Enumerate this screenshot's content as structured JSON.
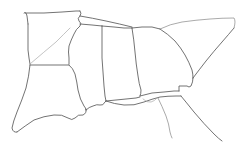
{
  "map": {
    "title": "Southeastern United States outline map",
    "type": "line-drawing",
    "background_color": "#ffffff",
    "stroke_color": "#5a5a5a",
    "stroke_color_light": "#8d8d8d",
    "stroke_color_faint": "#a9a9a9",
    "width": 246,
    "height": 151,
    "regions": [
      {
        "name": "arkansas",
        "label": "",
        "path": "M24 14 L26 11 L27 15 L28 26 L28 40 L28 52 L29 60 L30 66 L36 66 L52 66 L68 66 L69 60 L69 55 L68 48 L68 40 L68 30 L69 22 L70 15 L72 12 L76 11 L80 11 L84 11 L75 12 L60 13 L44 14 Z"
      },
      {
        "name": "louisiana",
        "label": "",
        "path": "M30 66 L30 74 L28 84 L26 94 L22 104 L18 114 L14 122 L12 128 L14 132 L18 133 L24 129 L30 123 L36 119 L44 116 L52 114 L60 114 L66 117 L70 120 L74 119 L76 115 L80 113 L84 114 L86 111 L84 107 L82 101 L80 94 L79 86 L78 78 L76 70 L74 66 L68 66 Z"
      },
      {
        "name": "mississippi",
        "label": "",
        "path": "M69 22 L68 30 L68 40 L68 48 L69 55 L69 60 L68 66 L74 66 L76 70 L78 78 L79 86 L80 94 L82 101 L84 107 L86 111 L92 107 L98 105 L103 104 L106 101 L105 95 L104 88 L103 78 L102 66 L102 52 L102 40 L102 30 L102 26 L92 25 L82 24 L75 23 Z"
      },
      {
        "name": "alabama",
        "label": "",
        "path": "M102 26 L102 40 L102 52 L102 66 L103 78 L104 88 L105 95 L106 101 L112 100 L120 99 L130 98 L140 97 L142 93 L140 88 L138 82 L137 74 L136 64 L135 54 L134 44 L133 34 L132 28 L120 27 L110 26 Z"
      },
      {
        "name": "georgia",
        "label": "",
        "path": "M132 28 L133 34 L134 44 L135 54 L136 64 L137 74 L138 82 L140 88 L142 93 L152 92 L162 91 L172 90 L178 90 L178 84 L186 84 L188 90 L192 88 L194 82 L192 74 L190 66 L187 58 L184 50 L178 42 L170 34 L160 29 L148 27 Z"
      },
      {
        "name": "south-carolina",
        "label": "",
        "path": "M160 29 L170 34 L178 42 L184 50 L187 58 L190 66 L194 74 L200 68 L208 58 L216 48 L224 38 L230 30 L236 25 L230 22 L220 21 L208 22 L196 24 L182 26 Z"
      },
      {
        "name": "tennessee-border",
        "label": "",
        "path": "M84 11 L96 14 L110 18 L124 22 L136 25 L148 27 L160 29"
      },
      {
        "name": "florida-panhandle",
        "label": "",
        "path": "M86 111 L92 107 L98 105 L103 104 L106 101 L112 100 L120 99 L130 98 L140 97 L152 92 L162 91 L172 90 L178 90 L180 96 L186 101 L196 112 L206 124 L216 134 L222 140"
      },
      {
        "name": "florida-peninsula-hint",
        "label": "",
        "path": "M160 96 L164 104 L168 112 L170 122 L172 130 L174 136"
      }
    ],
    "strokes": [
      {
        "name": "arkansas-north-edge",
        "weight": "normal",
        "d": "M24 13 Q26 11 27 16 L28 24"
      },
      {
        "name": "arkansas-top-line",
        "weight": "normal",
        "d": "M25 13 L44 13 L62 12 L76 11 L80 11"
      },
      {
        "name": "arkansas-west-edge",
        "weight": "normal",
        "d": "M28 24 L28 38 L28 50 L29 58 L30 64"
      },
      {
        "name": "arkansas-mississippi-river",
        "weight": "normal",
        "d": "M80 11 Q82 13 80 16 Q77 18 79 21 Q82 23 80 26 Q76 29 74 34 Q71 40 69 46 Q68 52 69 58 L69 64"
      },
      {
        "name": "arkansas-south-line",
        "weight": "normal",
        "d": "M30 65 L44 65 L58 65 L69 65"
      },
      {
        "name": "arkansas-ouachita-diagonal",
        "weight": "faint",
        "d": "M30 64 Q44 52 56 42 Q64 34 70 28"
      },
      {
        "name": "louisiana-west-edge",
        "weight": "normal",
        "d": "M30 65 Q29 76 26 88 Q22 100 17 112 Q13 122 12 128 Q13 133 17 132"
      },
      {
        "name": "louisiana-gulf-coast",
        "weight": "normal",
        "d": "M17 132 Q25 126 34 120 Q44 116 54 115 Q62 114 68 118 Q72 121 75 118 Q78 114 83 115 Q87 113 86 109"
      },
      {
        "name": "louisiana-east-border",
        "weight": "normal",
        "d": "M69 65 Q73 68 75 74 Q77 82 78 90 Q80 100 84 106 Q86 108 86 110"
      },
      {
        "name": "mississippi-north-line",
        "weight": "normal",
        "d": "M80 24 L92 25 L102 26"
      },
      {
        "name": "mississippi-alabama-border",
        "weight": "normal",
        "d": "M102 26 L102 42 L102 58 L103 72 L104 86 L105 96 L106 101"
      },
      {
        "name": "mississippi-gulf-coast",
        "weight": "normal",
        "d": "M86 110 Q89 107 93 106 Q97 104 100 105 Q103 106 105 102 L106 101"
      },
      {
        "name": "alabama-north-line",
        "weight": "normal",
        "d": "M102 26 L114 27 L124 28 L132 28"
      },
      {
        "name": "alabama-georgia-border",
        "weight": "normal",
        "d": "M132 28 Q134 40 135 52 Q136 64 138 76 Q139 84 141 90 Q141 94 140 96"
      },
      {
        "name": "alabama-florida-line",
        "weight": "normal",
        "d": "M106 101 L116 100 L126 99 L136 98 L140 97"
      },
      {
        "name": "georgia-tennessee-line",
        "weight": "normal",
        "d": "M132 28 L142 27 L152 27 L160 29"
      },
      {
        "name": "georgia-south-carolina-border",
        "weight": "normal",
        "d": "M160 29 Q168 34 175 41 Q181 48 185 55 Q189 62 192 70 Q193 74 193 78"
      },
      {
        "name": "georgia-east-coast",
        "weight": "normal",
        "d": "M193 78 Q193 82 191 86 Q189 88 187 86 L179 86 L179 91"
      },
      {
        "name": "georgia-florida-line",
        "weight": "normal",
        "d": "M140 96 L152 93 L164 92 L174 91 L179 91"
      },
      {
        "name": "south-carolina-coast",
        "weight": "normal",
        "d": "M193 78 Q199 70 206 61 Q214 51 222 42 Q229 34 234 28"
      },
      {
        "name": "south-carolina-north-border",
        "weight": "light",
        "d": "M160 29 Q170 24 182 22 Q196 20 210 19 Q222 18 234 18 Q236 21 234 28"
      },
      {
        "name": "tennessee-upper-line",
        "weight": "normal",
        "d": "M80 16 Q92 18 106 21 Q120 24 132 27"
      },
      {
        "name": "florida-panhandle-coast",
        "weight": "normal",
        "d": "M106 101 Q114 104 124 105 Q134 106 144 102 Q152 99 160 97 Q168 96 176 96 L181 96"
      },
      {
        "name": "florida-east-coast",
        "weight": "normal",
        "d": "M181 96 Q186 102 194 112 Q204 124 214 134 Q219 139 222 141"
      },
      {
        "name": "florida-peninsula-west",
        "weight": "light",
        "d": "M158 98 Q162 106 166 116 Q169 124 170 132 Q171 136 172 138"
      },
      {
        "name": "florida-gulf-inlet",
        "weight": "faint",
        "d": "M143 99 Q147 103 151 102 Q155 101 157 98"
      }
    ]
  }
}
